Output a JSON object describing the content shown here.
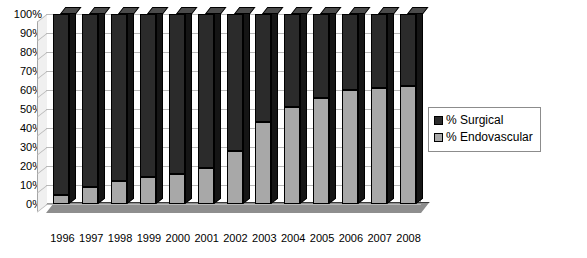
{
  "chart_data": {
    "type": "bar",
    "subtype": "stacked-100-percent-3d-column",
    "title": "",
    "xlabel": "",
    "ylabel": "",
    "categories": [
      "1996",
      "1997",
      "1998",
      "1999",
      "2000",
      "2001",
      "2002",
      "2003",
      "2004",
      "2005",
      "2006",
      "2007",
      "2008"
    ],
    "series": [
      {
        "name": "% Surgical",
        "color": "#2b2b2b",
        "values": [
          95,
          91,
          88,
          86,
          84,
          81,
          72,
          57,
          49,
          44,
          40,
          39,
          38
        ]
      },
      {
        "name": "% Endovascular",
        "color": "#a8a8a8",
        "values": [
          5,
          9,
          12,
          14,
          16,
          19,
          28,
          43,
          51,
          56,
          60,
          61,
          62
        ]
      }
    ],
    "ylim": [
      0,
      100
    ],
    "ytick_labels": [
      "0%",
      "10%",
      "20%",
      "30%",
      "40%",
      "50%",
      "60%",
      "70%",
      "80%",
      "90%",
      "100%"
    ],
    "ytick_values": [
      0,
      10,
      20,
      30,
      40,
      50,
      60,
      70,
      80,
      90,
      100
    ],
    "grid": true,
    "grid_axis": "y",
    "legend_position": "right",
    "legend_entries": [
      "% Surgical",
      "% Endovascular"
    ]
  },
  "legend": {
    "items": [
      {
        "label": "% Surgical",
        "color": "#2b2b2b"
      },
      {
        "label": "% Endovascular",
        "color": "#a8a8a8"
      }
    ]
  }
}
